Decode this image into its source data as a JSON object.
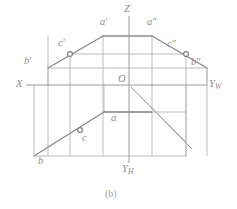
{
  "figure": {
    "caption": "(b)",
    "background_color": "#ffffff",
    "line_color": "#8a8a8a",
    "thin_line_color": "#b4b4b4",
    "axis_color": "#9a9a9a",
    "label_color": "#8c8c8c"
  },
  "axes": [
    {
      "id": "x",
      "label": "X",
      "x": 16,
      "y": 85
    },
    {
      "id": "z",
      "label": "Z",
      "x": 124,
      "y": 9
    },
    {
      "id": "yw",
      "label": "Y",
      "sub": "W",
      "x": 210,
      "y": 86
    },
    {
      "id": "yh",
      "label": "Y",
      "sub": "H",
      "x": 124,
      "y": 168
    }
  ],
  "origin": {
    "label": "O",
    "x": 127,
    "y": 82
  },
  "points": [
    {
      "id": "a-front",
      "label": "a",
      "prime": "′",
      "x": 100,
      "y": 22
    },
    {
      "id": "a-side",
      "label": "a",
      "prime": "″",
      "x": 147,
      "y": 22
    },
    {
      "id": "c-front",
      "label": "c",
      "prime": "′",
      "x": 69,
      "y": 40
    },
    {
      "id": "c-side",
      "label": "c",
      "prime": "″",
      "x": 167,
      "y": 41
    },
    {
      "id": "b-front",
      "label": "b",
      "prime": "′",
      "x": 26,
      "y": 61
    },
    {
      "id": "b-side",
      "label": "b",
      "prime": "″",
      "x": 192,
      "y": 62
    },
    {
      "id": "a-top",
      "label": "a",
      "prime": "",
      "x": 112,
      "y": 117
    },
    {
      "id": "c-top",
      "label": "c",
      "prime": "",
      "x": 85,
      "y": 135
    },
    {
      "id": "b-top",
      "label": "b",
      "prime": "",
      "x": 40,
      "y": 160
    }
  ],
  "geometry": {
    "axis_x_line": "M 26 85 L 205 85",
    "axis_z_line": "M 129 16 L 129 163",
    "axis_yw_line": "M 129 85 L 205 85",
    "axis_yh_line": "M 129 85 L 129 163",
    "bisector_line": "M 131 87 L 190 147",
    "front_view_outline": "M 48 68 L 103 36 L 152 36 L 207 68",
    "front_view_base": "M 48 68 L 48 85 M 207 68 L 207 85",
    "front_horizontal_top": "M 48 68 L 207 68",
    "front_apex_top": "M 103 36 L 152 36",
    "top_view_outline": "M 34 156 L 104 112 L 152 112",
    "top_view_box": "M 34 156 L 34 85 M 34 156 L 186 156 M 186 156 L 186 85",
    "top_view_inner_h": "M 104 112 L 186 112",
    "top_view_inner_v": "M 104 112 L 104 85",
    "top_view_diag": "M 131 87 L 186 142",
    "proj_verticals": [
      "M 48 36 L 48 156",
      "M 70 54 L 70 156",
      "M 103 36 L 103 156",
      "M 152 36 L 152 156",
      "M 186 54 L 186 156",
      "M 207 68 L 207 156"
    ],
    "proj_horizontals": [
      "M 70 54 L 186 54",
      "M 48 68 L 207 68",
      "M 104 112 L 186 112",
      "M 34 156 L 186 156"
    ],
    "markers": [
      {
        "id": "c-front-dot",
        "cx": 70,
        "cy": 54,
        "r": 2.4
      },
      {
        "id": "c-side-dot",
        "cx": 186,
        "cy": 54,
        "r": 2.4
      },
      {
        "id": "c-top-dot",
        "cx": 80,
        "cy": 130,
        "r": 2.4
      }
    ],
    "bold_segments": [
      "M 48 68 L 103 36",
      "M 152 36 L 207 68",
      "M 103 36 L 152 36",
      "M 34 156 L 104 112",
      "M 104 112 L 152 112"
    ]
  }
}
